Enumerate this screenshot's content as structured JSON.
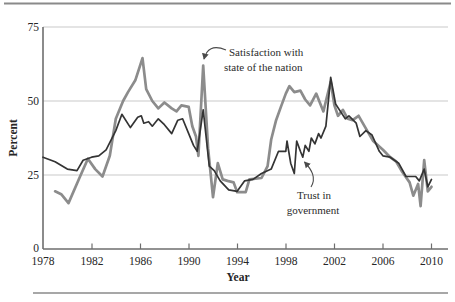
{
  "chart_data": {
    "type": "line",
    "title": "",
    "xlabel": "Year",
    "ylabel": "Percent",
    "xlim": [
      1978,
      2010
    ],
    "ylim": [
      0,
      75
    ],
    "grid": "horizontal",
    "x_tick_labels": [
      "1978",
      "1982",
      "1986",
      "1990",
      "1994",
      "1998",
      "2002",
      "2006",
      "2010"
    ],
    "y_tick_labels": [
      "75",
      "50",
      "25",
      "0"
    ],
    "annotations": {
      "satisfaction": {
        "line1": "Satisfaction with",
        "line2": "state of the nation",
        "points_to": "gray line spike at 1991"
      },
      "trust": {
        "line1": "Trust in",
        "line2": "government",
        "points_to": "dark line near 1999"
      }
    },
    "colors": {
      "satisfaction_line": "#8c8c8c",
      "trust_line": "#343434",
      "gridline": "#c9c9c9",
      "axis": "#6e6e6e",
      "rule": "#8a8a8a"
    },
    "series": [
      {
        "name": "Satisfaction with state of the nation",
        "color": "#8c8c8c",
        "points": [
          [
            1979.0,
            19.5
          ],
          [
            1979.5,
            18.5
          ],
          [
            1980.1,
            15.5
          ],
          [
            1981.0,
            24
          ],
          [
            1981.7,
            30.5
          ],
          [
            1982.3,
            27
          ],
          [
            1982.9,
            24.5
          ],
          [
            1983.5,
            31.5
          ],
          [
            1984.0,
            44
          ],
          [
            1984.6,
            50
          ],
          [
            1985.0,
            53
          ],
          [
            1985.6,
            57
          ],
          [
            1986.2,
            64.5
          ],
          [
            1986.5,
            54
          ],
          [
            1987.0,
            50
          ],
          [
            1987.5,
            47.5
          ],
          [
            1988.0,
            49.5
          ],
          [
            1988.6,
            47.5
          ],
          [
            1989.0,
            46.5
          ],
          [
            1989.4,
            48.5
          ],
          [
            1990.0,
            48
          ],
          [
            1990.3,
            41.5
          ],
          [
            1990.6,
            38
          ],
          [
            1990.8,
            31.5
          ],
          [
            1991.2,
            62
          ],
          [
            1991.6,
            34
          ],
          [
            1992.0,
            17.5
          ],
          [
            1992.4,
            29
          ],
          [
            1992.8,
            23.5
          ],
          [
            1993.2,
            23
          ],
          [
            1993.7,
            22.5
          ],
          [
            1994.0,
            19.2
          ],
          [
            1994.7,
            19.2
          ],
          [
            1995.0,
            23.5
          ],
          [
            1996.0,
            24
          ],
          [
            1996.5,
            28
          ],
          [
            1996.8,
            37
          ],
          [
            1997.2,
            43.5
          ],
          [
            1997.6,
            48
          ],
          [
            1998.0,
            52.5
          ],
          [
            1998.3,
            55
          ],
          [
            1998.7,
            53
          ],
          [
            1999.2,
            53.5
          ],
          [
            1999.6,
            50.5
          ],
          [
            2000.0,
            48.5
          ],
          [
            2000.5,
            52.5
          ],
          [
            2001.1,
            46.5
          ],
          [
            2001.7,
            56.5
          ],
          [
            2002.0,
            48.5
          ],
          [
            2002.3,
            45
          ],
          [
            2002.7,
            47
          ],
          [
            2003.1,
            44
          ],
          [
            2003.5,
            43.5
          ],
          [
            2004.0,
            45
          ],
          [
            2004.7,
            40
          ],
          [
            2005.2,
            36.5
          ],
          [
            2006.0,
            33.5
          ],
          [
            2006.6,
            31
          ],
          [
            2007.1,
            29.5
          ],
          [
            2007.6,
            26
          ],
          [
            2008.2,
            22.5
          ],
          [
            2008.5,
            18
          ],
          [
            2008.9,
            22
          ],
          [
            2009.1,
            14.5
          ],
          [
            2009.4,
            30
          ],
          [
            2009.7,
            19.5
          ],
          [
            2010.0,
            21
          ]
        ]
      },
      {
        "name": "Trust in government",
        "color": "#343434",
        "points": [
          [
            1978.0,
            31
          ],
          [
            1979.0,
            29.5
          ],
          [
            1980.0,
            27
          ],
          [
            1980.8,
            26.5
          ],
          [
            1981.3,
            30
          ],
          [
            1982.0,
            31
          ],
          [
            1982.6,
            31.5
          ],
          [
            1983.2,
            33.5
          ],
          [
            1984.0,
            40
          ],
          [
            1984.5,
            45.5
          ],
          [
            1985.2,
            41
          ],
          [
            1985.8,
            44.5
          ],
          [
            1986.1,
            45
          ],
          [
            1986.3,
            42.5
          ],
          [
            1986.7,
            43
          ],
          [
            1987.0,
            41.5
          ],
          [
            1987.5,
            44
          ],
          [
            1988.0,
            42
          ],
          [
            1988.6,
            39
          ],
          [
            1989.1,
            43.5
          ],
          [
            1989.5,
            44
          ],
          [
            1990.0,
            39
          ],
          [
            1990.4,
            35
          ],
          [
            1990.7,
            33
          ],
          [
            1991.2,
            47
          ],
          [
            1991.7,
            28
          ],
          [
            1992.1,
            26.5
          ],
          [
            1992.6,
            23
          ],
          [
            1993.3,
            20
          ],
          [
            1994.0,
            19.5
          ],
          [
            1994.6,
            23
          ],
          [
            1995.3,
            23.5
          ],
          [
            1996.0,
            25.5
          ],
          [
            1996.8,
            27
          ],
          [
            1997.4,
            33
          ],
          [
            1998.0,
            33
          ],
          [
            1998.1,
            36.5
          ],
          [
            1998.4,
            29
          ],
          [
            1998.7,
            25.5
          ],
          [
            1998.9,
            36.5
          ],
          [
            1999.2,
            33
          ],
          [
            1999.4,
            31
          ],
          [
            1999.6,
            35
          ],
          [
            1999.9,
            33
          ],
          [
            2000.1,
            37.5
          ],
          [
            2000.4,
            35.5
          ],
          [
            2000.7,
            39
          ],
          [
            2000.9,
            37.5
          ],
          [
            2001.3,
            41.5
          ],
          [
            2001.7,
            58
          ],
          [
            2002.1,
            49
          ],
          [
            2002.5,
            46.5
          ],
          [
            2002.9,
            44
          ],
          [
            2003.2,
            45
          ],
          [
            2003.8,
            42.5
          ],
          [
            2004.1,
            38
          ],
          [
            2004.6,
            40
          ],
          [
            2005.1,
            38.5
          ],
          [
            2005.7,
            33
          ],
          [
            2006.0,
            31.5
          ],
          [
            2006.6,
            31
          ],
          [
            2007.3,
            29
          ],
          [
            2007.9,
            24.5
          ],
          [
            2008.7,
            24.5
          ],
          [
            2009.0,
            23
          ],
          [
            2009.4,
            27
          ],
          [
            2009.7,
            21
          ],
          [
            2010.0,
            23.5
          ]
        ]
      }
    ]
  }
}
